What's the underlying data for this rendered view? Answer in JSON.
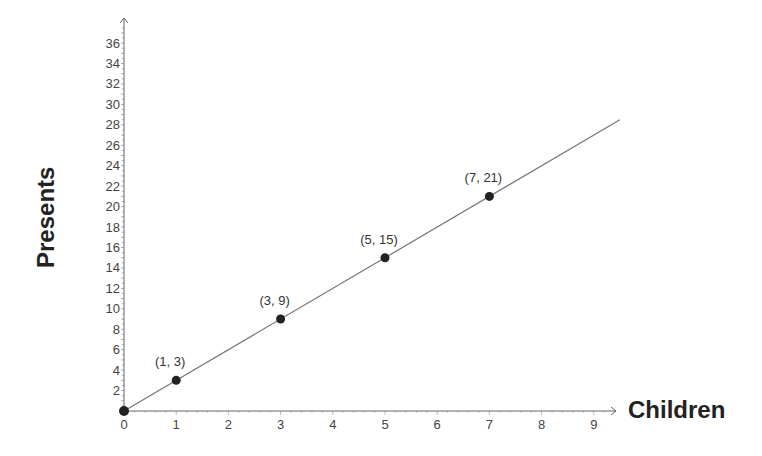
{
  "chart_data": {
    "type": "scatter",
    "title": "",
    "xlabel": "Children",
    "ylabel": "Presents",
    "x_ticks": [
      0,
      1,
      2,
      3,
      4,
      5,
      6,
      7,
      8,
      9
    ],
    "y_ticks": [
      2,
      4,
      6,
      8,
      10,
      12,
      14,
      16,
      18,
      20,
      22,
      24,
      26,
      28,
      30,
      32,
      34,
      36
    ],
    "xlim": [
      0,
      9.5
    ],
    "ylim": [
      0,
      38
    ],
    "grid": false,
    "legend": null,
    "series": [
      {
        "name": "Presents = 3 × Children",
        "points": [
          {
            "x": 0,
            "y": 0,
            "label": ""
          },
          {
            "x": 1,
            "y": 3,
            "label": "(1, 3)"
          },
          {
            "x": 3,
            "y": 9,
            "label": "(3, 9)"
          },
          {
            "x": 5,
            "y": 15,
            "label": "(5, 15)"
          },
          {
            "x": 7,
            "y": 21,
            "label": "(7, 21)"
          }
        ],
        "line": {
          "from": [
            0,
            0
          ],
          "to": [
            9.5,
            28.5
          ],
          "slope": 3
        }
      }
    ],
    "colors": {
      "axis": "#555555",
      "line": "#666666",
      "point": "#222222",
      "text": "#444444"
    }
  }
}
